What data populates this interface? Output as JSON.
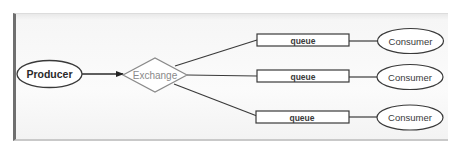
{
  "diagram": {
    "type": "message-broker-flow",
    "producer": {
      "label": "Producer"
    },
    "exchange": {
      "label": "Exchange"
    },
    "queues": [
      {
        "label": "queue"
      },
      {
        "label": "queue"
      },
      {
        "label": "queue"
      }
    ],
    "consumers": [
      {
        "label": "Consumer"
      },
      {
        "label": "Consumer"
      },
      {
        "label": "Consumer"
      }
    ],
    "edges": [
      {
        "from": "Producer",
        "to": "Exchange",
        "arrow": true
      },
      {
        "from": "Exchange",
        "to": "queue 1",
        "arrow": false
      },
      {
        "from": "Exchange",
        "to": "queue 2",
        "arrow": false
      },
      {
        "from": "Exchange",
        "to": "queue 3",
        "arrow": false
      },
      {
        "from": "queue 1",
        "to": "Consumer 1",
        "arrow": false
      },
      {
        "from": "queue 2",
        "to": "Consumer 2",
        "arrow": false
      },
      {
        "from": "queue 3",
        "to": "Consumer 3",
        "arrow": false
      }
    ],
    "colors": {
      "stroke": "#3a3a3a",
      "exchange_stroke": "#8a8a8a",
      "text": "#2a2a2a",
      "exchange_text": "#8a8a8a",
      "frame_border": "#6f6f6f"
    }
  }
}
